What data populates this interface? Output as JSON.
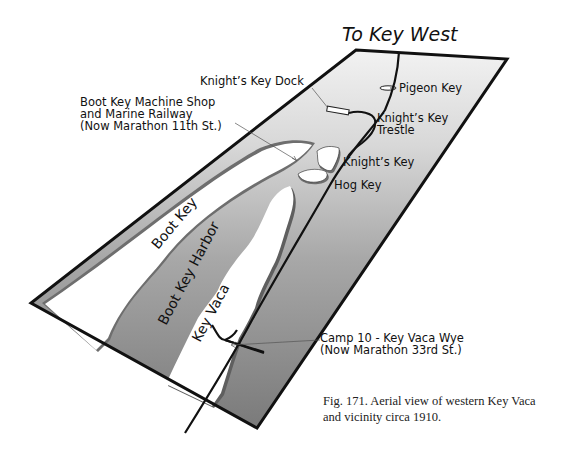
{
  "map": {
    "title": "To Key West",
    "labels": {
      "knights_key_dock": "Knight’s Key Dock",
      "pigeon_key": "Pigeon Key",
      "knights_key_trestle_1": "Knight’s Key",
      "knights_key_trestle_2": "Trestle",
      "knights_key": "Knight’s Key",
      "hog_key": "Hog Key",
      "machine_shop_1": "Boot Key Machine Shop",
      "machine_shop_2": "and Marine Railway",
      "machine_shop_3": "(Now Marathon 11th St.)",
      "boot_key": "Boot Key",
      "boot_key_harbor": "Boot Key Harbor",
      "key_vaca": "Key Vaca",
      "camp10_1": "Camp 10 - Key Vaca Wye",
      "camp10_2": "(Now Marathon 33rd St.)"
    },
    "colors": {
      "water_light": "#e6e6e6",
      "water_dark": "#8a8a8a",
      "land": "#ffffff",
      "outline": "#111111",
      "shoreline_shadow": "#6e6e6e"
    }
  },
  "caption": {
    "line1": "Fig. 171. Aerial view of western Key Vaca",
    "line2": "and vicinity circa 1910."
  }
}
